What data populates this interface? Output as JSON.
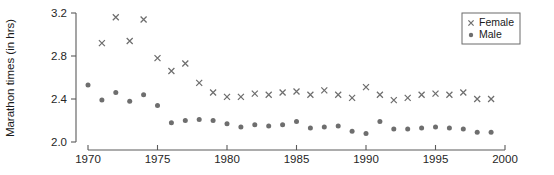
{
  "chart_data": {
    "type": "scatter",
    "title": "",
    "xlabel": "",
    "ylabel": "Marathon times (in hrs)",
    "xlim": [
      1970,
      2000
    ],
    "ylim": [
      2.0,
      3.2
    ],
    "xticks": [
      1970,
      1975,
      1980,
      1985,
      1990,
      1995,
      2000
    ],
    "xticklabels": [
      "1970",
      "1975",
      "1980",
      "1985",
      "1990",
      "1995",
      "2000"
    ],
    "yticks": [
      2.0,
      2.4,
      2.8,
      3.2
    ],
    "yticklabels": [
      "2.0",
      "2.4",
      "2.8",
      "3.2"
    ],
    "grid": false,
    "legend_position": "top-right",
    "marker_color": "#6e6e6e",
    "axis_color": "#5a5a5a",
    "series": [
      {
        "name": "Female",
        "marker": "x",
        "x": [
          1971,
          1972,
          1973,
          1974,
          1975,
          1976,
          1977,
          1978,
          1979,
          1980,
          1981,
          1982,
          1983,
          1984,
          1985,
          1986,
          1987,
          1988,
          1989,
          1990,
          1991,
          1992,
          1993,
          1994,
          1995,
          1996,
          1997,
          1998,
          1999
        ],
        "values": [
          2.92,
          3.16,
          2.94,
          3.14,
          2.78,
          2.66,
          2.73,
          2.55,
          2.46,
          2.42,
          2.42,
          2.45,
          2.44,
          2.46,
          2.47,
          2.44,
          2.48,
          2.44,
          2.41,
          2.51,
          2.44,
          2.39,
          2.41,
          2.44,
          2.45,
          2.44,
          2.46,
          2.4,
          2.4
        ]
      },
      {
        "name": "Male",
        "marker": "o",
        "x": [
          1970,
          1971,
          1972,
          1973,
          1974,
          1975,
          1976,
          1977,
          1978,
          1979,
          1980,
          1981,
          1982,
          1983,
          1984,
          1985,
          1986,
          1987,
          1988,
          1989,
          1990,
          1991,
          1992,
          1993,
          1994,
          1995,
          1996,
          1997,
          1998,
          1999
        ],
        "values": [
          2.53,
          2.39,
          2.46,
          2.38,
          2.44,
          2.34,
          2.18,
          2.2,
          2.21,
          2.2,
          2.17,
          2.14,
          2.16,
          2.15,
          2.16,
          2.19,
          2.13,
          2.14,
          2.15,
          2.1,
          2.08,
          2.19,
          2.12,
          2.12,
          2.13,
          2.14,
          2.13,
          2.12,
          2.09,
          2.09
        ]
      }
    ]
  },
  "legend": {
    "entries": [
      {
        "label": "Female",
        "marker": "x-marker-icon"
      },
      {
        "label": "Male",
        "marker": "dot-marker-icon"
      }
    ]
  }
}
